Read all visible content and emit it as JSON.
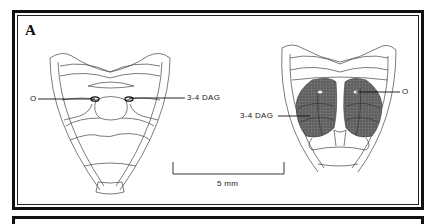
{
  "figure": {
    "panel_label": "A",
    "left_specimen": {
      "labels": {
        "o": "O",
        "dag": "3-4 DAG"
      }
    },
    "right_specimen": {
      "labels": {
        "o": "O",
        "dag": "3-4 DAG"
      }
    },
    "scale_bar": {
      "label": "5 mm"
    },
    "colors": {
      "line": "#333333",
      "stipple": "#5a5a5a",
      "frame": "#111111"
    }
  }
}
